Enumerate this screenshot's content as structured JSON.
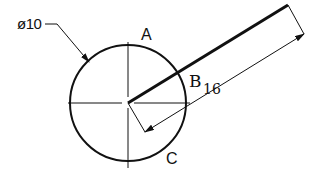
{
  "diagram": {
    "type": "technical-drawing",
    "labels": {
      "diameter": "ø10",
      "point_a": "A",
      "point_b": "B",
      "dimension_value": "16",
      "point_c": "C"
    },
    "circle": {
      "diameter": 10,
      "center": "origin"
    },
    "segment": {
      "from": "circle center",
      "length": 16
    },
    "colors": {
      "stroke": "#111111",
      "background": "#ffffff"
    }
  }
}
